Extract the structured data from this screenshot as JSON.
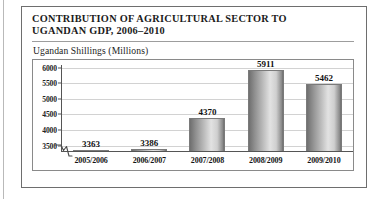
{
  "figure": {
    "title": "CONTRIBUTION OF AGRICULTURAL SECTOR TO\nUGANDAN GDP, 2006–2010",
    "subtitle": "Ugandan Shillings (Millions)"
  },
  "chart_data": {
    "type": "bar",
    "title": "CONTRIBUTION OF AGRICULTURAL SECTOR TO UGANDAN GDP, 2006–2010",
    "subtitle": "Ugandan Shillings (Millions)",
    "categories": [
      "2005/2006",
      "2006/2007",
      "2007/2008",
      "2008/2009",
      "2009/2010"
    ],
    "values": [
      3363,
      3386,
      4370,
      5911,
      5462
    ],
    "value_labels": [
      "3363",
      "3386",
      "4370",
      "5911",
      "5462"
    ],
    "xlabel": "",
    "ylabel": "Ugandan Shillings (Millions)",
    "ylim": [
      3300,
      6250
    ],
    "yticks": [
      3500,
      4000,
      4500,
      5000,
      5500,
      6000
    ],
    "ytick_labels": [
      "3500",
      "4000",
      "4500",
      "5000",
      "5500",
      "6000"
    ],
    "axis_break": true,
    "grid": true,
    "legend": false,
    "bar_color": "#b5b5b5",
    "bar_edge_color": "#7a7a7a",
    "grid_color": "#d2d2d2",
    "axis_color": "#555555"
  }
}
